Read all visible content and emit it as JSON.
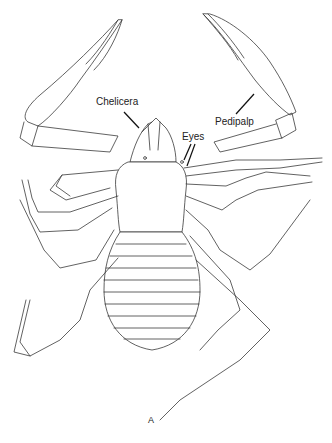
{
  "figure": {
    "panel_label": "A",
    "labels": {
      "chelicera": "Chelicera",
      "eyes": "Eyes",
      "pedipalp": "Pedipalp"
    },
    "colors": {
      "line": "#3a3a3a",
      "background": "#ffffff",
      "text": "#222222"
    },
    "abdomen_segments": 10
  }
}
